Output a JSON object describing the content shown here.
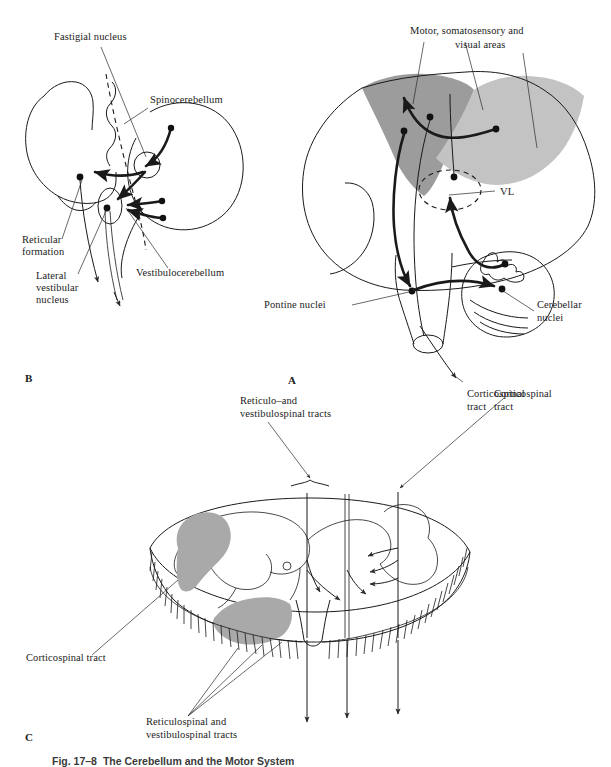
{
  "figure": {
    "caption_number": "Fig. 17–8",
    "caption_text": "The Cerebellum and the Motor System"
  },
  "panels": [
    {
      "id": "A",
      "letter": "A",
      "name": "brain-sagittal-view"
    },
    {
      "id": "B",
      "letter": "B",
      "name": "cerebellum-brainstem-view"
    },
    {
      "id": "C",
      "letter": "C",
      "name": "spinal-cord-cross-section"
    }
  ],
  "panel_b": {
    "letter": "B",
    "labels": {
      "fastigial_nucleus": "Fastigial nucleus",
      "spinocerebellum": "Spinocerebellum",
      "reticular_formation_line1": "Reticular",
      "reticular_formation_line2": "formation",
      "lateral_vestibular_line1": "Lateral",
      "lateral_vestibular_line2": "vestibular",
      "lateral_vestibular_line3": "nucleus",
      "vestibulocerebellum": "Vestibulocerebellum"
    }
  },
  "panel_a": {
    "letter": "A",
    "labels": {
      "cortical_areas_line1": "Motor, somatosensory and",
      "cortical_areas_line2": "visual areas",
      "vl": "VL",
      "pontine_nuclei": "Pontine nuclei",
      "cerebellar_nuclei_line1": "Cerebellar",
      "cerebellar_nuclei_line2": "nuclei",
      "corticospinal_tract_line1": "Corticospinal",
      "corticospinal_tract_line2": "tract"
    }
  },
  "panel_c": {
    "letter": "C",
    "labels": {
      "reticulo_vestibulospinal_line1": "Reticulo–and",
      "reticulo_vestibulospinal_line2": "vestibulospinal tracts",
      "corticospinal_tract_top_line1": "Corticospinal",
      "corticospinal_tract_top_line2": "tract",
      "corticospinal_tract_left": "Corticospinal tract",
      "reticulospinal_vestibulospinal_line1": "Reticulospinal and",
      "reticulospinal_vestibulospinal_line2": "vestibulospinal tracts"
    }
  },
  "colors": {
    "ink": "#1a1a1a",
    "shade_dark": "#9c9c9c",
    "shade_light": "#c3c3c3",
    "shade_gray_matter": "#a9a9a9",
    "paper": "#ffffff"
  }
}
